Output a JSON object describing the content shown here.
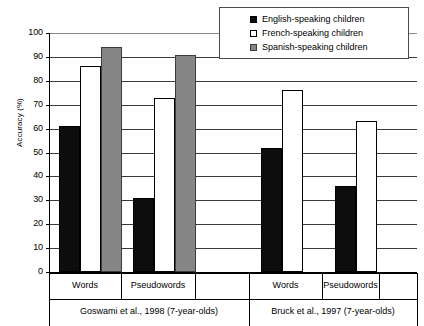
{
  "chart_data": {
    "type": "bar",
    "title": "",
    "subtitle": "",
    "xlabel": "",
    "ylabel": "Accuracy (%)",
    "ylim": [
      0,
      100
    ],
    "ytick_labels": [
      "100",
      "90",
      "80",
      "70",
      "60",
      "50",
      "40",
      "30",
      "20",
      "10",
      "0"
    ],
    "ytick_values": [
      100,
      90,
      80,
      70,
      60,
      50,
      40,
      30,
      20,
      10,
      0
    ],
    "grid": true,
    "grid_axis": "y",
    "legend_position": "top-right",
    "categories": [
      "Words",
      "Pseudowords",
      "Words",
      "Pseudowords"
    ],
    "group_labels": [
      "Goswami et al., 1998 (7-year-olds)",
      "Bruck et al., 1997 (7-year-olds)"
    ],
    "groups": [
      {
        "source": "Goswami et al., 1998 (7-year-olds)",
        "categories": [
          "Words",
          "Pseudowords"
        ]
      },
      {
        "source": "Bruck et al., 1997 (7-year-olds)",
        "categories": [
          "Words",
          "Pseudowords"
        ]
      }
    ],
    "series": [
      {
        "name": "English-speaking children",
        "color": "#0d0d0d",
        "values": [
          61,
          31,
          52,
          36
        ]
      },
      {
        "name": "French-speaking children",
        "color": "#ffffff",
        "values": [
          86,
          73,
          76,
          63
        ]
      },
      {
        "name": "Spanish-speaking children",
        "color": "#858585",
        "values": [
          94,
          91,
          null,
          null
        ]
      }
    ],
    "bars": [
      {
        "group": 0,
        "category": "Words",
        "series": "English-speaking children",
        "value": 61
      },
      {
        "group": 0,
        "category": "Words",
        "series": "French-speaking children",
        "value": 86
      },
      {
        "group": 0,
        "category": "Words",
        "series": "Spanish-speaking children",
        "value": 94
      },
      {
        "group": 0,
        "category": "Pseudowords",
        "series": "English-speaking children",
        "value": 31
      },
      {
        "group": 0,
        "category": "Pseudowords",
        "series": "French-speaking children",
        "value": 73
      },
      {
        "group": 0,
        "category": "Pseudowords",
        "series": "Spanish-speaking children",
        "value": 91
      },
      {
        "group": 1,
        "category": "Words",
        "series": "English-speaking children",
        "value": 52
      },
      {
        "group": 1,
        "category": "Words",
        "series": "French-speaking children",
        "value": 76
      },
      {
        "group": 1,
        "category": "Pseudowords",
        "series": "English-speaking children",
        "value": 36
      },
      {
        "group": 1,
        "category": "Pseudowords",
        "series": "French-speaking children",
        "value": 63
      }
    ]
  },
  "legend": {
    "items": [
      {
        "label": "English-speaking children",
        "swatch": "black-square-icon"
      },
      {
        "label": "French-speaking children",
        "swatch": "white-square-icon"
      },
      {
        "label": "Spanish-speaking children",
        "swatch": "gray-square-icon"
      }
    ]
  },
  "axes": {
    "y_title": "Accuracy (%)",
    "y_ticks": [
      "100",
      "90",
      "80",
      "70",
      "60",
      "50",
      "40",
      "30",
      "20",
      "10",
      "0"
    ]
  },
  "x_categories": [
    "Words",
    "Pseudowords",
    "Words",
    "Pseudowords"
  ],
  "x_sources": [
    "Goswami et al., 1998 (7-year-olds)",
    "Bruck et al., 1997 (7-year-olds)"
  ]
}
